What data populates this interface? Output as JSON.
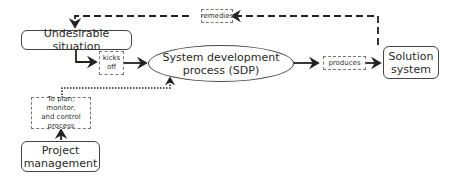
{
  "nodes": {
    "undesirable": {
      "label": "Undesirable situation"
    },
    "sdp": {
      "line1": "System development",
      "line2": "process (SDP)"
    },
    "solution": {
      "line1": "Solution",
      "line2": "system"
    },
    "pm": {
      "line1": "Project",
      "line2": "management"
    }
  },
  "edge_labels": {
    "remedies": "remedies",
    "kicks_off_1": "kicks",
    "kicks_off_2": "off",
    "produces": "produces",
    "plan_1": "To plan, monitor,",
    "plan_2": "and control",
    "plan_3": "process"
  }
}
